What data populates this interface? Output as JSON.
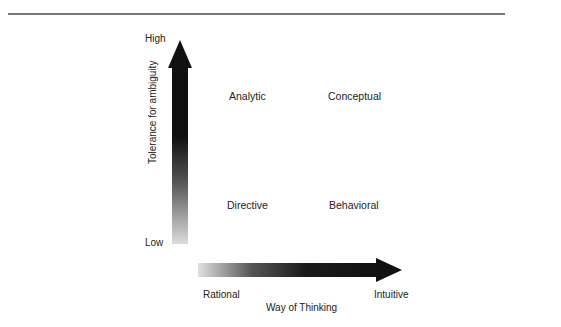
{
  "diagram": {
    "y_axis": {
      "title": "Tolerance for ambiguity",
      "high_label": "High",
      "low_label": "Low"
    },
    "x_axis": {
      "title": "Way of Thinking",
      "left_label": "Rational",
      "right_label": "Intuitive"
    },
    "quadrants": {
      "top_left": "Analytic",
      "top_right": "Conceptual",
      "bottom_left": "Directive",
      "bottom_right": "Behavioral"
    },
    "colors": {
      "arrow_dark": "#111111",
      "arrow_light": "#d8d8d8",
      "rule": "#777777"
    }
  }
}
